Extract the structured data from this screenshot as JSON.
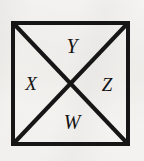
{
  "figure": {
    "name": "square-with-diagonals",
    "background_color": "#f3f2f0",
    "stroke_color": "#161616",
    "label_color": "#131313",
    "square": {
      "left": 11,
      "top": 21,
      "right": 130,
      "bottom": 146,
      "border_width": 4
    },
    "diagonals": {
      "width": 4,
      "intersection": {
        "x": 70,
        "y": 84
      },
      "count": 2
    }
  },
  "labels": [
    {
      "text": "Y",
      "region": "top",
      "x": 69,
      "y": 46,
      "font_size": 20
    },
    {
      "text": "X",
      "region": "left",
      "x": 31,
      "y": 84,
      "font_size": 19
    },
    {
      "text": "Z",
      "region": "right",
      "x": 107,
      "y": 85,
      "font_size": 19
    },
    {
      "text": "W",
      "region": "bottom",
      "x": 69,
      "y": 122,
      "font_size": 20
    }
  ]
}
